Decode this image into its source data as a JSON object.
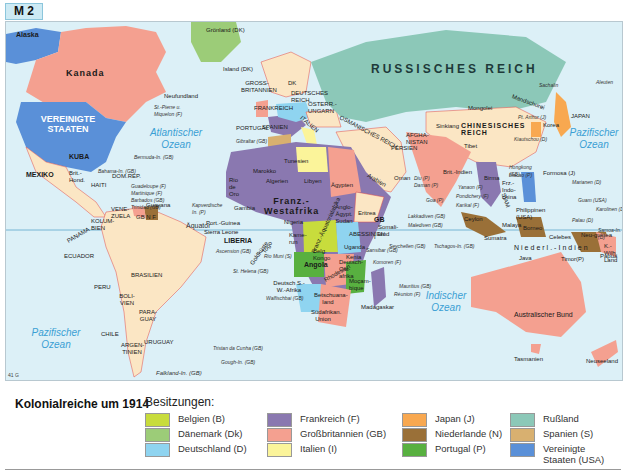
{
  "header": {
    "tag": "M 2"
  },
  "map": {
    "code": "41 G",
    "equator_label": "Äquator",
    "oceans": [
      {
        "id": "atlantic",
        "label": "Atlantischer\nOzean"
      },
      {
        "id": "pacific_east",
        "label": "Pazifischer\nOzean"
      },
      {
        "id": "pacific_west",
        "label": "Pazifischer\nOzean"
      },
      {
        "id": "indian",
        "label": "Indischer\nOzean"
      }
    ],
    "regions": {
      "alaska": "Alaska",
      "kanada": "Kanada",
      "usa": "VEREINIGTE STAATEN",
      "neufundland": "Neufundland",
      "stpierre": "St.-Pierre u. Miquelon (F)",
      "bermuda": "Bermuda-In. (GB)",
      "bahama": "Bahama-In. (GB)",
      "groenland": "Grönland (DK)",
      "island": "Island (DK)",
      "grossbritannien": "GROSS-BRITANNIEN",
      "dk": "DK",
      "frankreich": "FRANKREICH",
      "deutsches_reich": "DEUTSCHES REICH",
      "oesterreich": "ÖSTERR.-UNGARN",
      "italien": "ITALIEN",
      "portugal": "PORTUGAL",
      "spanien": "SPANIEN",
      "gibraltar": "Gibraltar (GB)",
      "russland": "RUSSISCHES REICH",
      "osmanisches": "OSMANISCHES REICH",
      "persien": "PERSIEN",
      "afghanistan": "AFGHA-NISTAN",
      "mongolei": "Mongolei",
      "mandschurei": "Mandschurei",
      "sinkiang": "Sinkiang",
      "china": "CHINESISCHES REICH",
      "tibet": "Tibet",
      "sachalin": "Sachalin",
      "aleuten": "Aleuten",
      "japan": "JAPAN",
      "korea": "Korea",
      "portarthur": "Pt. Arthur (J)",
      "kiautschou": "Kiautschou (D)",
      "hongkong": "Hongkong (GB)",
      "macao": "Macao (P)",
      "formosa": "Formosa (J)",
      "marianen": "Marianen (D)",
      "guam": "Guam (USA)",
      "karolinen": "Karolinen (D)",
      "palau": "Palau (D)",
      "philippinen": "Philippinen (USA)",
      "kuba": "KUBA",
      "mexiko": "MEXIKO",
      "brit_honduras": "Brit.-Hond.",
      "haiti": "HAITI",
      "dom_rep": "DOM.REP.",
      "guadeloupe": "Guadeloupe (F)",
      "martinique": "Martinique (F)",
      "barbados": "Barbados (GB)",
      "trinidad": "Trinidad (GB)",
      "panama": "PANAMA",
      "kolumbien": "KOLUM-BIEN",
      "venezuela": "VENE-ZUELA",
      "guayana": "Guayana",
      "gb_nl_f": "GB N F",
      "ecuador": "ECUADOR",
      "peru": "PERU",
      "brasilien": "BRASILIEN",
      "bolivien": "BOLI-VIEN",
      "paraguay": "PARA-GUAY",
      "chile": "CHILE",
      "argentinien": "ARGEN-TINIEN",
      "uruguay": "URUGUAY",
      "falkland": "Falkland-In. (GB)",
      "marokko": "Marokko",
      "tunesien": "Tunesien",
      "algerien": "Algerien",
      "libyen": "Libyen",
      "aegypten": "Ägypten",
      "rio_de_oro": "Rio de Oro",
      "kapverden": "Kapverdische In. (P)",
      "gambia": "Gambia",
      "franz_westafrika": "Franz.-Westafrika",
      "port_guinea": "Port.-Guinea",
      "sierra_leone": "Sierra Leone",
      "liberia": "LIBERIA",
      "goldkueste": "Goldküste",
      "togo": "Togo",
      "nigeria": "Nigeria",
      "kamerun": "Kame-run",
      "rio_muni": "Rio Muni (S)",
      "franz_aequatorialafrika": "Franz.-Äquatorialafrika",
      "anglo_aegypt_sudan": "Anglo-Ägypt. Sudan",
      "eritrea": "Eritrea",
      "abessinien": "ABESSINIEN",
      "somaliland": "Somali-land",
      "gb_somali": "GB",
      "it_somali": "I",
      "uganda": "Uganda",
      "kenia": "Kenia",
      "belg_kongo": "Belg. Kongo",
      "deutsch_ostafrika": "Deutsch-Ost-afrika",
      "angola": "Angola",
      "rhodesien": "Rhodesien",
      "mocambique": "Moçam-bique",
      "deutsch_sw_afrika": "Deutsch S.-W.-Afrika",
      "walfischbai": "Walfischbai (GB)",
      "betschuanaland": "Betschuana-land",
      "suedafrikan_union": "Südafrikan. Union",
      "madagaskar": "Madagaskar",
      "ascension": "Ascension (GB)",
      "st_helena": "St. Helena (GB)",
      "tristan": "Tristan da Cunha (GB)",
      "gough": "Gough-In. (GB)",
      "seychellen": "Seychellen (GB)",
      "sansibar": "Sansibar (GB)",
      "komoren": "Komoren (F)",
      "mauritius": "Mauritius (GB)",
      "reunion": "Réunion (F)",
      "arabien": "Arabien",
      "oman": "Oman",
      "brit_indien": "Brit.-Indien",
      "diu": "Diu (P)",
      "daman": "Daman (P)",
      "goa": "Goa (P)",
      "yanaon": "Yanaon (F)",
      "pondichery": "Pondichery (F)",
      "karikal": "Karikal (F)",
      "ceylon": "Ceylon",
      "lakkadiven": "Lakkadiven (GB)",
      "malediven": "Malediven (GB)",
      "tschagos": "Tschagos-In. (GB)",
      "birma": "Birma",
      "siam": "SIAM",
      "franz_indochina": "Frz.-Indo-china",
      "malaya": "Malaya",
      "sumatra": "Sumatra",
      "borneo": "Borneo",
      "celebes": "Celebes",
      "java": "Java",
      "timor": "Timor(P)",
      "niederl_indien": "Niederl.-Indien",
      "neuguinea": "Neu-guinea",
      "papua": "Papua",
      "samoa": "Samoa-In.(D)",
      "kaiser_wilhelm_land": "K.-Wilh. Land",
      "australien": "Australischer Bund",
      "tasmanien": "Tasmanien",
      "neuseeland": "Neuseeland"
    }
  },
  "legend": {
    "title": "Kolonialreiche um 1914",
    "subtitle": "Besitzungen:",
    "items": [
      {
        "label": "Belgien (B)",
        "color": "#c8dc3c"
      },
      {
        "label": "Dänemark (Dk)",
        "color": "#9ccc78"
      },
      {
        "label": "Deutschland (D)",
        "color": "#8fd4f0"
      },
      {
        "label": "Frankreich (F)",
        "color": "#8a78b0"
      },
      {
        "label": "Großbritannien (GB)",
        "color": "#f4a090"
      },
      {
        "label": "Italien (I)",
        "color": "#fbf49a"
      },
      {
        "label": "Japan (J)",
        "color": "#f8a850"
      },
      {
        "label": "Niederlande (N)",
        "color": "#9a7038"
      },
      {
        "label": "Portugal (P)",
        "color": "#58b040"
      },
      {
        "label": "Rußland",
        "color": "#8cc8b8"
      },
      {
        "label": "Spanien (S)",
        "color": "#d8b070"
      },
      {
        "label": "Vereinigte Staaten (USA)",
        "color": "#5a90d8"
      }
    ]
  },
  "colors": {
    "ocean": "#dcf0f7",
    "independent": "#fbe6c4",
    "border_red": "#e04848",
    "ocean_text": "#3a9fd4"
  }
}
